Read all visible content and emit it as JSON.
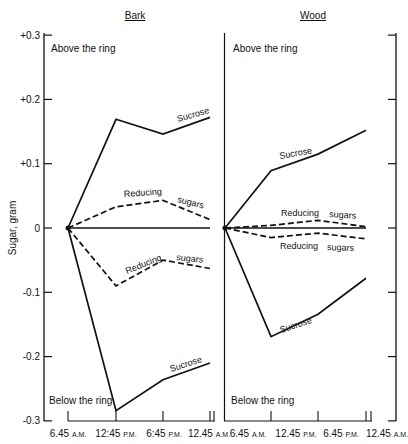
{
  "chart_data": {
    "type": "line",
    "title": "",
    "ylabel": "Sugar, gram",
    "xlabel": "",
    "ylim": [
      -0.3,
      0.3
    ],
    "yticks": [
      0.3,
      0.2,
      0.1,
      0,
      -0.1,
      -0.2,
      -0.3
    ],
    "ytick_labels": [
      "+0.3",
      "+0.2",
      "+0.1",
      "0",
      "-0.1",
      "-0.2",
      "-0.3"
    ],
    "grid": false,
    "legend": "inline labels",
    "panels": [
      {
        "name": "Bark",
        "above_label": "Above the ring",
        "below_label": "Below the ring",
        "x_labels": [
          {
            "time": "6.45",
            "ampm": "A.M."
          },
          {
            "time": "12:45",
            "ampm": "P.M."
          },
          {
            "time": "6:45",
            "ampm": "P.M."
          },
          {
            "time": "12.45",
            "ampm": "A.M."
          }
        ],
        "series": [
          {
            "name": "Sucrose (above)",
            "style": "solid",
            "label": "Sucrose",
            "values": [
              0,
              0.169,
              0.146,
              0.172
            ]
          },
          {
            "name": "Reducing sugars (above)",
            "style": "dashed",
            "label": [
              "Reducing",
              "sugars"
            ],
            "values": [
              0,
              0.033,
              0.043,
              0.013
            ]
          },
          {
            "name": "Zero baseline",
            "style": "solid",
            "values": [
              0,
              0,
              0,
              0
            ]
          },
          {
            "name": "Reducing sugars (below)",
            "style": "dashed",
            "label": [
              "Reducing",
              "sugars"
            ],
            "values": [
              0,
              -0.09,
              -0.05,
              -0.063
            ]
          },
          {
            "name": "Sucrose (below)",
            "style": "solid",
            "label": "Sucrose",
            "values": [
              0,
              -0.284,
              -0.236,
              -0.21
            ]
          }
        ]
      },
      {
        "name": "Wood",
        "above_label": "Above the ring",
        "below_label": "Below the ring",
        "x_labels": [
          {
            "time": "6.45",
            "ampm": "A.M."
          },
          {
            "time": "12.45",
            "ampm": "P.M."
          },
          {
            "time": "6.45",
            "ampm": "P.M."
          },
          {
            "time": "12.45",
            "ampm": "A.M."
          }
        ],
        "series": [
          {
            "name": "Sucrose (above)",
            "style": "solid",
            "label": "Sucrose",
            "values": [
              0,
              0.089,
              0.115,
              0.152
            ]
          },
          {
            "name": "Reducing sugars (above)",
            "style": "dashed",
            "label": [
              "Reducing",
              "sugars"
            ],
            "values": [
              0,
              0.004,
              0.012,
              0.002
            ]
          },
          {
            "name": "Zero baseline",
            "style": "solid",
            "values": [
              0,
              0,
              0,
              0
            ]
          },
          {
            "name": "Reducing sugars (below)",
            "style": "dashed",
            "label": [
              "Reducing",
              "sugars"
            ],
            "values": [
              0,
              -0.015,
              -0.008,
              -0.017
            ]
          },
          {
            "name": "Sucrose (below)",
            "style": "solid",
            "label": "Sucrose",
            "values": [
              0,
              -0.169,
              -0.134,
              -0.078
            ]
          }
        ]
      }
    ]
  }
}
